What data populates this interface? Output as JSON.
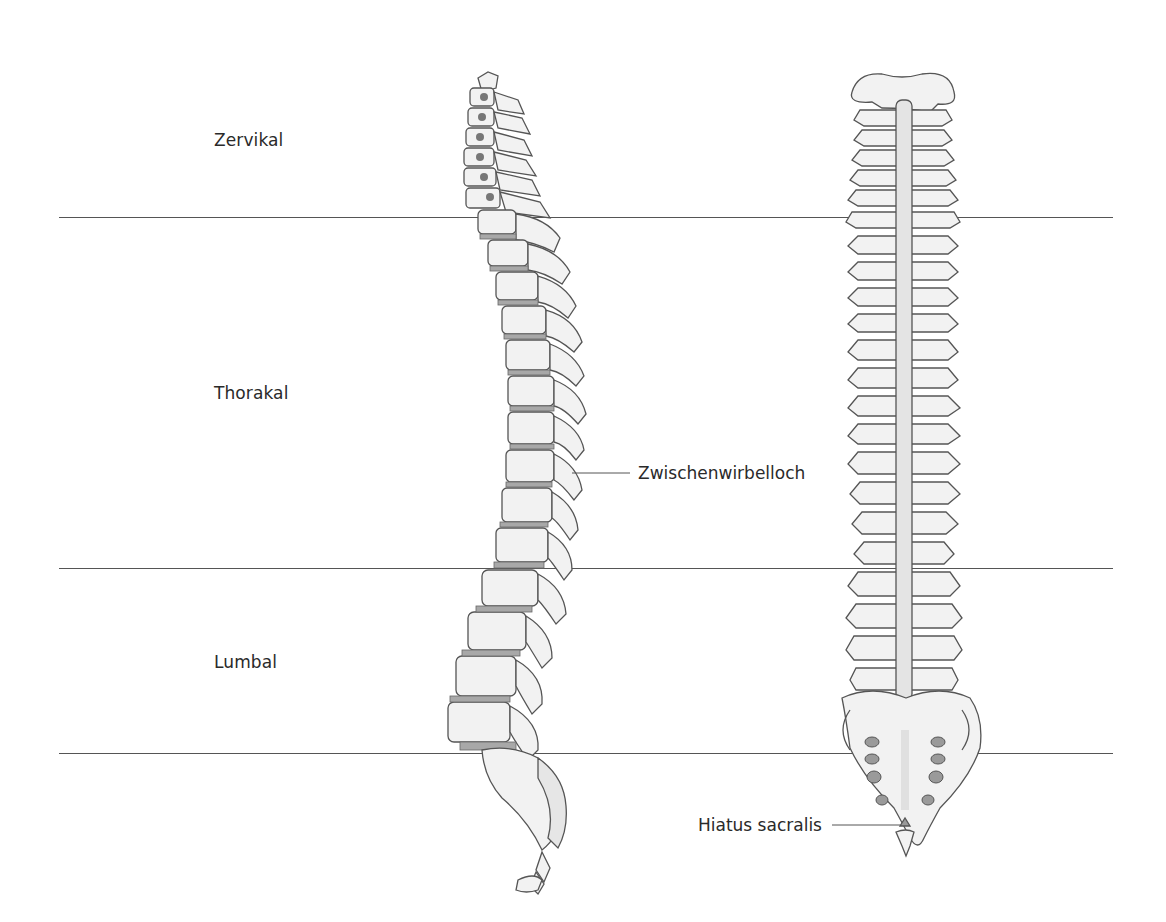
{
  "diagram": {
    "type": "anatomical-illustration",
    "views": [
      {
        "id": "lateral",
        "description": "side view of vertebral column"
      },
      {
        "id": "posterior",
        "description": "back view of vertebral column"
      }
    ],
    "regions": [
      {
        "label": "Zervikal",
        "y": 140
      },
      {
        "label": "Thorakal",
        "y": 393
      },
      {
        "label": "Lumbal",
        "y": 663
      }
    ],
    "dividers_y": [
      217,
      568,
      753
    ],
    "callouts": [
      {
        "label": "Zwischenwirbelloch",
        "view": "lateral"
      },
      {
        "label": "Hiatus sacralis",
        "view": "posterior"
      }
    ],
    "colors": {
      "bone_fill": "#f2f2f2",
      "bone_shade": "#dcdcdc",
      "outline": "#555555",
      "disc": "#a8a8a8",
      "foramen": "#9a9a9a",
      "line": "#555555",
      "text": "#2a2a2a"
    }
  }
}
